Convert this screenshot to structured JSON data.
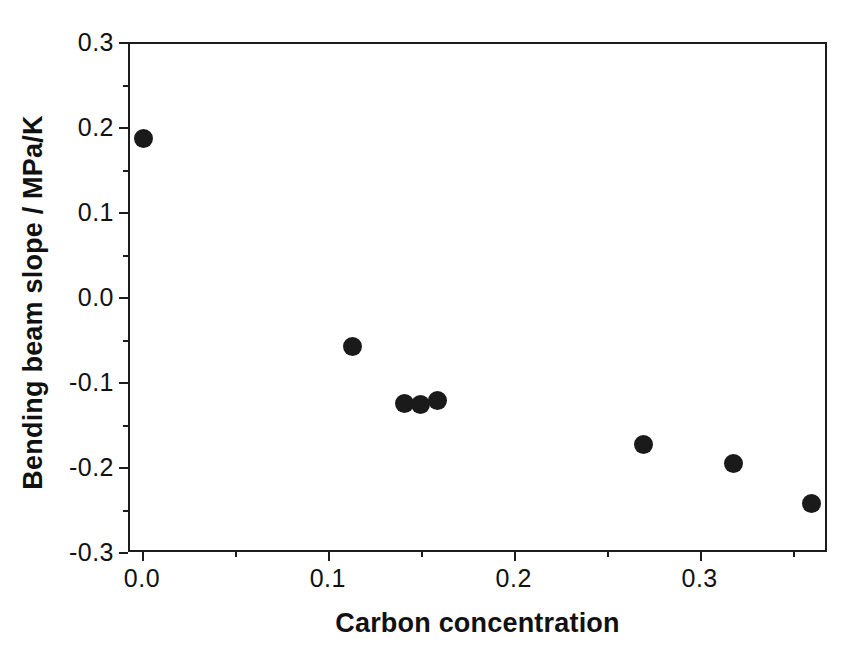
{
  "chart_data": {
    "type": "scatter",
    "title": "",
    "xlabel": "Carbon concentration",
    "ylabel": "Bending beam slope / MPa/K",
    "xlim": [
      -0.0075,
      0.3685
    ],
    "ylim": [
      -0.3,
      0.3
    ],
    "xticks": [
      "0.0",
      "0.1",
      "0.2",
      "0.3"
    ],
    "xtick_values": [
      0.0,
      0.1,
      0.2,
      0.3
    ],
    "yticks": [
      "0.3",
      "0.2",
      "0.1",
      "0.0",
      "-0.1",
      "-0.2",
      "-0.3"
    ],
    "ytick_values": [
      0.3,
      0.2,
      0.1,
      0.0,
      -0.1,
      -0.2,
      -0.3
    ],
    "minor_ticks": true,
    "grid": false,
    "legend": null,
    "marker": "filled-circle",
    "marker_color": "#1a1a1a",
    "marker_size_px": 19,
    "series": [
      {
        "name": "Bending beam slope",
        "x": [
          0.001,
          0.113,
          0.141,
          0.15,
          0.159,
          0.27,
          0.318,
          0.36
        ],
        "y": [
          0.187,
          -0.058,
          -0.125,
          -0.127,
          -0.122,
          -0.174,
          -0.196,
          -0.243
        ]
      }
    ]
  },
  "axes": {
    "frame_color": "#1c1c1c",
    "background": "#ffffff"
  }
}
